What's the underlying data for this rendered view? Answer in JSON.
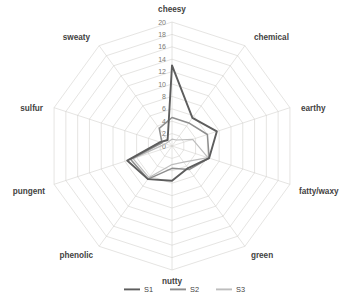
{
  "chart_data": {
    "type": "radar",
    "title": "",
    "subtitle": "",
    "xlabel": "",
    "ylabel": "",
    "categories": [
      "cheesy",
      "chemical",
      "earthy",
      "fatty/waxy",
      "green",
      "nutty",
      "phenolic",
      "pungent",
      "sulfur",
      "sweaty"
    ],
    "tick_labels": [
      "0",
      "2",
      "4",
      "6",
      "8",
      "10",
      "12",
      "14",
      "16",
      "18",
      "20"
    ],
    "tick_values": [
      0,
      2,
      4,
      6,
      8,
      10,
      12,
      14,
      16,
      18,
      20
    ],
    "rlim": [
      0,
      20
    ],
    "rings": 10,
    "grid": true,
    "legend_position": "bottom",
    "series": [
      {
        "name": "S1",
        "color": "#5d5d5d",
        "width": 1.9,
        "values": [
          13.0,
          5.6,
          7.6,
          6.3,
          4.4,
          5.6,
          6.6,
          7.6,
          2.0,
          1.2
        ]
      },
      {
        "name": "S2",
        "color": "#8e8e8e",
        "width": 1.5,
        "values": [
          4.6,
          4.6,
          6.0,
          6.3,
          4.7,
          3.6,
          6.6,
          7.0,
          1.7,
          3.5
        ]
      },
      {
        "name": "S3",
        "color": "#bdbdbd",
        "width": 1.2,
        "values": [
          1.1,
          1.2,
          3.5,
          6.1,
          3.2,
          3.0,
          6.3,
          6.6,
          1.1,
          0.9
        ]
      }
    ]
  },
  "legend": {
    "entries": [
      {
        "label": "S1"
      },
      {
        "label": "S2"
      },
      {
        "label": "S3"
      }
    ]
  },
  "geometry": {
    "cx": 172,
    "cy": 146,
    "radius": 124
  }
}
